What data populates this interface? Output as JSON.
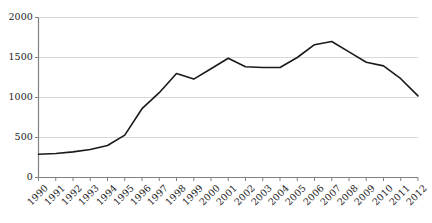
{
  "chart_data": {
    "type": "line",
    "title": "",
    "subtitle": "",
    "xlabel": "",
    "ylabel": "",
    "categories": [
      "1990",
      "1991",
      "1992",
      "1993",
      "1994",
      "1995",
      "1996",
      "1997",
      "1998",
      "1999",
      "2000",
      "2001",
      "2002",
      "2003",
      "2004",
      "2005",
      "2006",
      "2007",
      "2008",
      "2009",
      "2010",
      "2011",
      "2012"
    ],
    "values": [
      290,
      300,
      320,
      350,
      400,
      530,
      860,
      1060,
      1300,
      1230,
      1360,
      1490,
      1385,
      1375,
      1375,
      1500,
      1660,
      1700,
      1570,
      1440,
      1395,
      1235,
      1020
    ],
    "series": [
      {
        "name": "series-1",
        "values": [
          290,
          300,
          320,
          350,
          400,
          530,
          860,
          1060,
          1300,
          1230,
          1360,
          1490,
          1385,
          1375,
          1375,
          1500,
          1660,
          1700,
          1570,
          1440,
          1395,
          1235,
          1020
        ]
      }
    ],
    "yticks": [
      0,
      500,
      1000,
      1500,
      2000
    ],
    "ytick_labels": [
      "0",
      "500",
      "1000",
      "1500",
      "2000"
    ],
    "ylim": [
      0,
      2000
    ],
    "xlim": [
      "1990",
      "2012"
    ],
    "grid": "horizontal",
    "legend": "none",
    "line_color": "#1a1a1a",
    "grid_color": "#d9d9d9",
    "axis_color": "#808080",
    "text_color": "#1c1c1c",
    "background_color": "#ffffff",
    "xtick_rotation": -45
  }
}
